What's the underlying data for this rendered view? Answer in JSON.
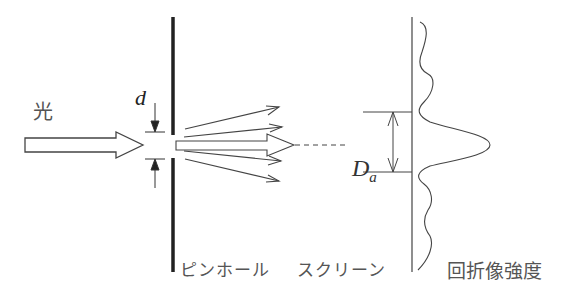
{
  "diagram": {
    "labels": {
      "light": "光",
      "aperture_diameter": "d",
      "spot_diameter_main": "D",
      "spot_diameter_sub": "a",
      "pinhole": "ピンホール",
      "screen": "スクリーン",
      "diffraction_intensity": "回折像強度"
    },
    "elements": [
      {
        "id": "incoming-light-arrow",
        "type": "hollow-arrow",
        "from": [
          22,
          145
        ],
        "to": [
          143,
          145
        ]
      },
      {
        "id": "pinhole-plate",
        "type": "thick-line",
        "x": 173,
        "y_top": 17,
        "y_bottom": 272,
        "gap": [
          135,
          158
        ]
      },
      {
        "id": "aperture-d-dimension",
        "type": "inward-arrows",
        "x": 154
      },
      {
        "id": "diffracted-rays",
        "type": "fan-arrows",
        "count": 5
      },
      {
        "id": "axis-dashed-line",
        "type": "dashed",
        "from": [
          293,
          145
        ],
        "to": [
          345,
          145
        ]
      },
      {
        "id": "screen-line",
        "type": "line",
        "x": 412
      },
      {
        "id": "Da-dimension",
        "type": "double-arrow",
        "x": 393,
        "y_top": 112,
        "y_bottom": 172
      },
      {
        "id": "intensity-profile",
        "type": "curve",
        "peak_y": 145
      }
    ],
    "colors": {
      "stroke": "#333333",
      "text": "#555555",
      "background": "#ffffff"
    }
  }
}
